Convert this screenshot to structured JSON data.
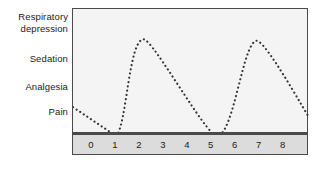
{
  "chart_data": {
    "type": "line",
    "title": "",
    "xlabel": "",
    "ylabel": "",
    "line_style": "dotted",
    "line_color": "#333333",
    "plot_background": "#f4f4f4",
    "frame_color": "#4a4a4a",
    "axis_band_color": "#dcdcdc",
    "grid": false,
    "legend": "none",
    "xlim": [
      -0.75,
      9.1
    ],
    "ylim": [
      0,
      4.4
    ],
    "x_tick_labels": [
      "0",
      "1",
      "2",
      "3",
      "4",
      "5",
      "6",
      "7",
      "8"
    ],
    "x_tick_values": [
      0,
      1,
      2,
      3,
      4,
      5,
      6,
      7,
      8
    ],
    "y_category_labels": [
      "Respiratory depression",
      "Sedation",
      "Analgesia",
      "Pain"
    ],
    "y_category_label_lines": [
      [
        "Respiratory",
        "depression"
      ],
      [
        "Sedation"
      ],
      [
        "Analgesia"
      ],
      [
        "Pain"
      ]
    ],
    "y_category_values": [
      4,
      3,
      2,
      1
    ],
    "series": [
      {
        "name": "effect level",
        "x": [
          -0.75,
          1.05,
          2.2,
          5.25,
          6.9,
          9.1
        ],
        "values": [
          1.0,
          0.0,
          3.35,
          0.0,
          3.3,
          0.65
        ],
        "annotations": [
          "starts at Pain level and falls to baseline at x=1",
          "rises to a peak just above Sedation at x=2.2",
          "declines to baseline at x=5.25",
          "rises to a second peak just above Sedation at x=6.9",
          "declines toward Pain level at the right edge"
        ]
      }
    ]
  }
}
